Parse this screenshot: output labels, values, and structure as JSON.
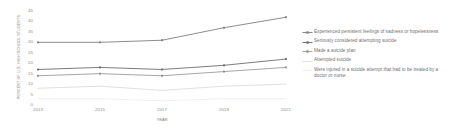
{
  "chart_data": {
    "type": "line",
    "title": "",
    "xlabel": "YEAR",
    "ylabel": "PERCENT OF U.S. HIGH SCHOOL STUDENTS",
    "x": [
      "2013",
      "2015",
      "2017",
      "2019",
      "2021"
    ],
    "categories": [
      "2013",
      "2015",
      "2017",
      "2019",
      "2021"
    ],
    "ylim": [
      0,
      45
    ],
    "yticks": [
      "0",
      "5",
      "10",
      "15",
      "20",
      "25",
      "30",
      "35",
      "40",
      "45"
    ],
    "ytick_values": [
      0,
      5,
      10,
      15,
      20,
      25,
      30,
      35,
      40,
      45
    ],
    "grid": false,
    "legend_position": "right",
    "series": [
      {
        "name": "Experienced persistent feelings of sadness or hopelessness",
        "values": [
          30,
          30,
          31,
          37,
          42
        ],
        "color": "#808080",
        "marker": "square",
        "width": 0.9
      },
      {
        "name": "Seriously considered attempting suicide",
        "values": [
          17,
          18,
          17,
          19,
          22
        ],
        "color": "#6e6e6e",
        "marker": "square",
        "width": 0.9
      },
      {
        "name": "Made a suicide plan",
        "values": [
          14,
          15,
          14,
          16,
          18
        ],
        "color": "#8f8f8f",
        "marker": "square",
        "width": 0.8
      },
      {
        "name": "Attempted suicide",
        "values": [
          8,
          9,
          7,
          9,
          10
        ],
        "color": "#d2d2d2",
        "marker": "none",
        "width": 0.7
      },
      {
        "name": "Were injured in a suicide attempt that had to be treated by a doctor or nurse",
        "values": [
          3,
          3,
          2,
          3,
          3
        ],
        "color": "#e8e8e8",
        "marker": "none",
        "width": 0.7
      }
    ]
  },
  "legend": {
    "items": [
      {
        "label": "Experienced persistent feelings of sadness or hopelessness"
      },
      {
        "label": "Seriously considered attempting suicide"
      },
      {
        "label": "Made a suicide plan"
      },
      {
        "label": "Attempted suicide"
      },
      {
        "label": "Were injured in a suicide attempt that had to be treated by a doctor or nurse"
      }
    ]
  }
}
